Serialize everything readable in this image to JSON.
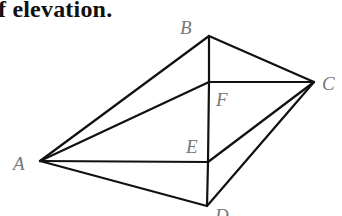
{
  "caption": "f elevation.",
  "diagram": {
    "type": "pyramid-like solid (3D figure)",
    "points": {
      "A": [
        40,
        161
      ],
      "B": [
        209,
        36
      ],
      "C": [
        314,
        82
      ],
      "D": [
        207,
        206
      ],
      "E": [
        208,
        162
      ],
      "F": [
        209,
        82
      ]
    },
    "labels": [
      {
        "text": "A",
        "x": 13,
        "y": 170
      },
      {
        "text": "B",
        "x": 180,
        "y": 34
      },
      {
        "text": "C",
        "x": 322,
        "y": 90
      },
      {
        "text": "D",
        "x": 215,
        "y": 222
      },
      {
        "text": "E",
        "x": 186,
        "y": 153
      },
      {
        "text": "F",
        "x": 216,
        "y": 106
      }
    ],
    "edges": [
      [
        "A",
        "B"
      ],
      [
        "B",
        "C"
      ],
      [
        "B",
        "F"
      ],
      [
        "F",
        "C"
      ],
      [
        "A",
        "F"
      ],
      [
        "A",
        "E"
      ],
      [
        "E",
        "C"
      ],
      [
        "F",
        "E"
      ],
      [
        "E",
        "D"
      ],
      [
        "A",
        "D"
      ],
      [
        "D",
        "C"
      ]
    ],
    "line_color": "#111111",
    "label_color": "#777777"
  }
}
